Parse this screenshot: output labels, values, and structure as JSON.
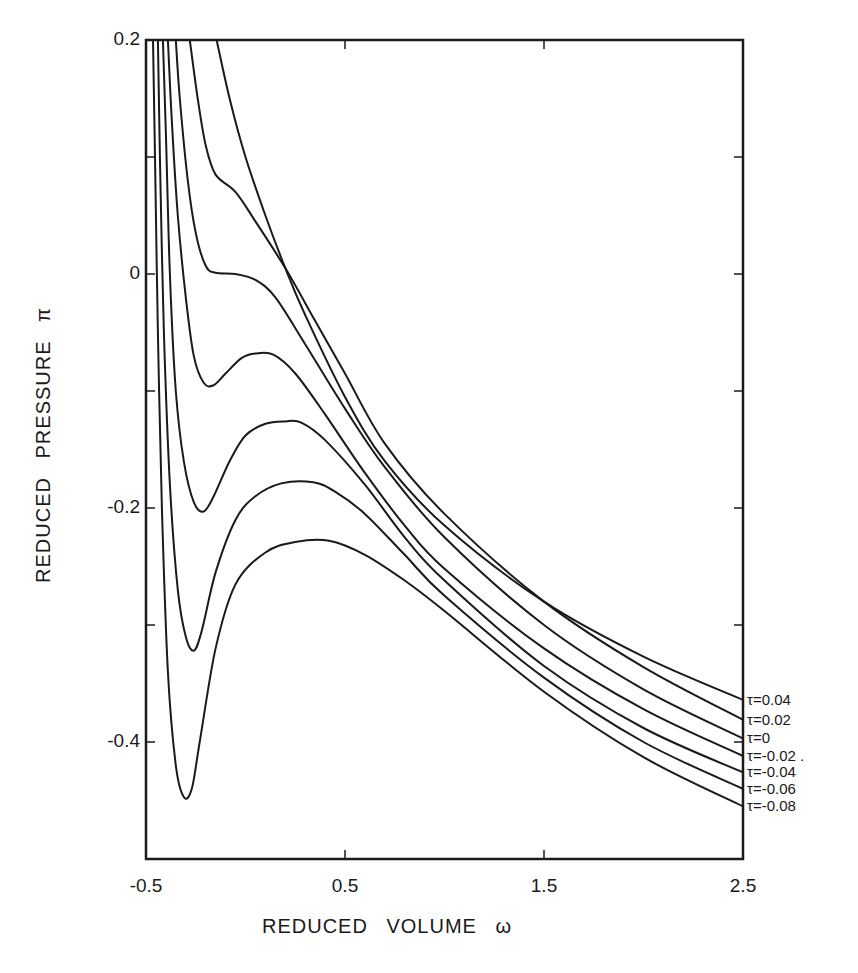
{
  "chart_data": {
    "type": "line",
    "title": "",
    "xlabel": "REDUCED  VOLUME  ω",
    "ylabel": "REDUCED  PRESSURE  π",
    "xlim": [
      -0.5,
      2.5
    ],
    "ylim": [
      -0.5,
      0.2
    ],
    "grid": false,
    "legend_position": "right-edge inline labels",
    "x_ticks": [
      {
        "value": -0.5,
        "label": "-0.5"
      },
      {
        "value": 0.5,
        "label": "0.5"
      },
      {
        "value": 1.5,
        "label": "1.5"
      },
      {
        "value": 2.5,
        "label": "2.5"
      }
    ],
    "y_ticks": [
      {
        "value": 0.2,
        "label": "0.2"
      },
      {
        "value": 0.1,
        "label": ""
      },
      {
        "value": 0,
        "label": "0"
      },
      {
        "value": -0.1,
        "label": ""
      },
      {
        "value": -0.2,
        "label": "-0.2"
      },
      {
        "value": -0.3,
        "label": ""
      },
      {
        "value": -0.4,
        "label": "-0.4"
      }
    ],
    "series": [
      {
        "name": "τ=0.04",
        "label": "τ=0.04",
        "points": [
          [
            -0.145,
            0.2
          ],
          [
            -0.08,
            0.15
          ],
          [
            0.0,
            0.1
          ],
          [
            0.1,
            0.05
          ],
          [
            0.2,
            0.005
          ],
          [
            0.3,
            -0.035
          ],
          [
            0.5,
            -0.105
          ],
          [
            0.7,
            -0.16
          ],
          [
            1.0,
            -0.215
          ],
          [
            1.5,
            -0.28
          ],
          [
            2.0,
            -0.327
          ],
          [
            2.5,
            -0.364
          ]
        ]
      },
      {
        "name": "τ=0.02",
        "label": "τ=0.02",
        "points": [
          [
            -0.28,
            0.2
          ],
          [
            -0.24,
            0.15
          ],
          [
            -0.2,
            0.11
          ],
          [
            -0.15,
            0.085
          ],
          [
            -0.05,
            0.07
          ],
          [
            0.05,
            0.045
          ],
          [
            0.2,
            0.005
          ],
          [
            0.35,
            -0.04
          ],
          [
            0.5,
            -0.085
          ],
          [
            0.7,
            -0.145
          ],
          [
            1.0,
            -0.205
          ],
          [
            1.5,
            -0.28
          ],
          [
            2.0,
            -0.336
          ],
          [
            2.5,
            -0.381
          ]
        ]
      },
      {
        "name": "τ=0",
        "label": "τ=0",
        "points": [
          [
            -0.35,
            0.2
          ],
          [
            -0.33,
            0.15
          ],
          [
            -0.29,
            0.08
          ],
          [
            -0.25,
            0.035
          ],
          [
            -0.2,
            0.007
          ],
          [
            -0.15,
            0.001
          ],
          [
            -0.05,
            0.0
          ],
          [
            0.05,
            -0.005
          ],
          [
            0.15,
            -0.02
          ],
          [
            0.3,
            -0.06
          ],
          [
            0.5,
            -0.115
          ],
          [
            0.7,
            -0.165
          ],
          [
            1.0,
            -0.225
          ],
          [
            1.5,
            -0.3
          ],
          [
            2.0,
            -0.355
          ],
          [
            2.5,
            -0.397
          ]
        ]
      },
      {
        "name": "τ=-0.02",
        "label": "τ=-0.02 .",
        "points": [
          [
            -0.39,
            0.2
          ],
          [
            -0.37,
            0.13
          ],
          [
            -0.34,
            0.05
          ],
          [
            -0.3,
            -0.02
          ],
          [
            -0.26,
            -0.07
          ],
          [
            -0.21,
            -0.093
          ],
          [
            -0.16,
            -0.095
          ],
          [
            -0.1,
            -0.085
          ],
          [
            -0.02,
            -0.072
          ],
          [
            0.05,
            -0.068
          ],
          [
            0.14,
            -0.069
          ],
          [
            0.25,
            -0.085
          ],
          [
            0.4,
            -0.12
          ],
          [
            0.6,
            -0.17
          ],
          [
            0.8,
            -0.215
          ],
          [
            1.0,
            -0.252
          ],
          [
            1.5,
            -0.32
          ],
          [
            2.0,
            -0.372
          ],
          [
            2.5,
            -0.412
          ]
        ]
      },
      {
        "name": "τ=-0.04",
        "label": "τ=-0.04",
        "points": [
          [
            -0.415,
            0.2
          ],
          [
            -0.4,
            0.12
          ],
          [
            -0.38,
            0.0
          ],
          [
            -0.35,
            -0.1
          ],
          [
            -0.31,
            -0.16
          ],
          [
            -0.26,
            -0.195
          ],
          [
            -0.21,
            -0.203
          ],
          [
            -0.16,
            -0.19
          ],
          [
            -0.08,
            -0.16
          ],
          [
            0.0,
            -0.138
          ],
          [
            0.1,
            -0.128
          ],
          [
            0.2,
            -0.126
          ],
          [
            0.28,
            -0.127
          ],
          [
            0.4,
            -0.142
          ],
          [
            0.6,
            -0.18
          ],
          [
            0.8,
            -0.225
          ],
          [
            1.0,
            -0.262
          ],
          [
            1.5,
            -0.335
          ],
          [
            2.0,
            -0.388
          ],
          [
            2.5,
            -0.426
          ]
        ]
      },
      {
        "name": "τ=-0.06",
        "label": "τ=-0.06",
        "points": [
          [
            -0.44,
            0.2
          ],
          [
            -0.43,
            0.1
          ],
          [
            -0.41,
            -0.05
          ],
          [
            -0.38,
            -0.18
          ],
          [
            -0.34,
            -0.27
          ],
          [
            -0.3,
            -0.31
          ],
          [
            -0.26,
            -0.322
          ],
          [
            -0.22,
            -0.305
          ],
          [
            -0.15,
            -0.255
          ],
          [
            -0.05,
            -0.21
          ],
          [
            0.05,
            -0.19
          ],
          [
            0.18,
            -0.179
          ],
          [
            0.34,
            -0.178
          ],
          [
            0.45,
            -0.186
          ],
          [
            0.6,
            -0.205
          ],
          [
            0.8,
            -0.24
          ],
          [
            1.0,
            -0.275
          ],
          [
            1.5,
            -0.345
          ],
          [
            2.0,
            -0.4
          ],
          [
            2.5,
            -0.44
          ]
        ]
      },
      {
        "name": "τ=-0.08",
        "label": "τ=-0.08",
        "points": [
          [
            -0.465,
            0.2
          ],
          [
            -0.455,
            0.1
          ],
          [
            -0.44,
            -0.05
          ],
          [
            -0.42,
            -0.2
          ],
          [
            -0.39,
            -0.34
          ],
          [
            -0.35,
            -0.42
          ],
          [
            -0.31,
            -0.447
          ],
          [
            -0.27,
            -0.44
          ],
          [
            -0.23,
            -0.4
          ],
          [
            -0.15,
            -0.32
          ],
          [
            -0.05,
            -0.265
          ],
          [
            0.1,
            -0.238
          ],
          [
            0.25,
            -0.229
          ],
          [
            0.42,
            -0.228
          ],
          [
            0.6,
            -0.24
          ],
          [
            0.8,
            -0.262
          ],
          [
            1.0,
            -0.288
          ],
          [
            1.5,
            -0.357
          ],
          [
            2.0,
            -0.413
          ],
          [
            2.5,
            -0.455
          ]
        ]
      }
    ]
  },
  "axes": {
    "x_title": "REDUCED  VOLUME  ω",
    "y_title": "REDUCED  PRESSURE  π"
  }
}
